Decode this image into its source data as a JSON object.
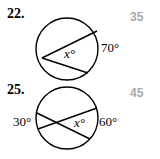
{
  "problems": [
    {
      "number": "22.",
      "answer": "35",
      "arc_label": "70°",
      "angle_label": "x°",
      "circle": {
        "cx": 67,
        "cy": 49,
        "r": 31
      },
      "chords": [
        [
          42,
          57,
          97,
          31
        ],
        [
          42,
          58,
          88,
          73
        ]
      ]
    },
    {
      "number": "25.",
      "answer": "45",
      "arc_left_label": "30°",
      "arc_right_label": "60°",
      "angle_label": "x°",
      "circle": {
        "cx": 67,
        "cy": 118,
        "r": 31
      },
      "chords": [
        [
          37,
          117,
          90,
          137
        ],
        [
          38,
          128,
          97,
          108
        ]
      ]
    }
  ]
}
